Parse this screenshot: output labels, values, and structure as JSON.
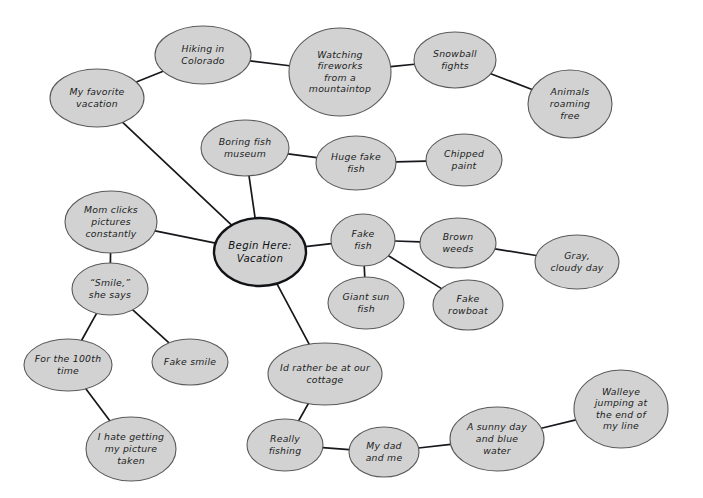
{
  "diagram": {
    "type": "mind-map",
    "background_color": "#ffffff",
    "node_fill_color": "#d2d2d2",
    "node_stroke_color": "#5a5a5a",
    "root_stroke_color": "#111317",
    "edge_color": "#16181c",
    "text_color": "#1b1d22",
    "canvas": {
      "width": 703,
      "height": 498
    }
  },
  "nodes": [
    {
      "id": "root",
      "label_lines": [
        "Begin Here:",
        "Vacation"
      ],
      "cx": 260,
      "cy": 252,
      "rx": 46,
      "ry": 34,
      "is_root": true
    },
    {
      "id": "my-favorite-vacation",
      "label_lines": [
        "My favorite",
        "vacation"
      ],
      "cx": 97,
      "cy": 98,
      "rx": 47,
      "ry": 29,
      "is_root": false
    },
    {
      "id": "hiking-in-colorado",
      "label_lines": [
        "Hiking in",
        "Colorado"
      ],
      "cx": 203,
      "cy": 55,
      "rx": 48,
      "ry": 29,
      "is_root": false
    },
    {
      "id": "watching-fireworks",
      "label_lines": [
        "Watching",
        "fireworks",
        "from a",
        "mountaintop"
      ],
      "cx": 340,
      "cy": 72,
      "rx": 51,
      "ry": 44,
      "is_root": false
    },
    {
      "id": "snowball-fights",
      "label_lines": [
        "Snowball",
        "fights"
      ],
      "cx": 455,
      "cy": 60,
      "rx": 41,
      "ry": 28,
      "is_root": false
    },
    {
      "id": "animals-roaming-free",
      "label_lines": [
        "Animals",
        "roaming",
        "free"
      ],
      "cx": 570,
      "cy": 104,
      "rx": 42,
      "ry": 34,
      "is_root": false
    },
    {
      "id": "boring-fish-museum",
      "label_lines": [
        "Boring fish",
        "museum"
      ],
      "cx": 245,
      "cy": 148,
      "rx": 44,
      "ry": 28,
      "is_root": false
    },
    {
      "id": "huge-fake-fish",
      "label_lines": [
        "Huge fake",
        "fish"
      ],
      "cx": 356,
      "cy": 163,
      "rx": 40,
      "ry": 27,
      "is_root": false
    },
    {
      "id": "chipped-paint",
      "label_lines": [
        "Chipped",
        "paint"
      ],
      "cx": 464,
      "cy": 160,
      "rx": 38,
      "ry": 26,
      "is_root": false
    },
    {
      "id": "mom-clicks-pictures",
      "label_lines": [
        "Mom clicks",
        "pictures",
        "constantly"
      ],
      "cx": 111,
      "cy": 222,
      "rx": 46,
      "ry": 31,
      "is_root": false
    },
    {
      "id": "smile-she-says",
      "label_lines": [
        "“Smile,”",
        "she says"
      ],
      "cx": 110,
      "cy": 289,
      "rx": 38,
      "ry": 26,
      "is_root": false
    },
    {
      "id": "for-the-100th-time",
      "label_lines": [
        "For the 100th",
        "time"
      ],
      "cx": 68,
      "cy": 365,
      "rx": 44,
      "ry": 26,
      "is_root": false
    },
    {
      "id": "fake-smile",
      "label_lines": [
        "Fake smile"
      ],
      "cx": 190,
      "cy": 362,
      "rx": 38,
      "ry": 23,
      "is_root": false
    },
    {
      "id": "i-hate-getting-my-picture-taken",
      "label_lines": [
        "I hate getting",
        "my picture",
        "taken"
      ],
      "cx": 131,
      "cy": 449,
      "rx": 45,
      "ry": 32,
      "is_root": false
    },
    {
      "id": "fake-fish",
      "label_lines": [
        "Fake",
        "fish"
      ],
      "cx": 363,
      "cy": 240,
      "rx": 32,
      "ry": 26,
      "is_root": false
    },
    {
      "id": "brown-weeds",
      "label_lines": [
        "Brown",
        "weeds"
      ],
      "cx": 458,
      "cy": 243,
      "rx": 38,
      "ry": 25,
      "is_root": false
    },
    {
      "id": "gray-cloudy-day",
      "label_lines": [
        "Gray,",
        "cloudy day"
      ],
      "cx": 577,
      "cy": 262,
      "rx": 42,
      "ry": 27,
      "is_root": false
    },
    {
      "id": "giant-sun-fish",
      "label_lines": [
        "Giant sun",
        "fish"
      ],
      "cx": 366,
      "cy": 303,
      "rx": 38,
      "ry": 26,
      "is_root": false
    },
    {
      "id": "fake-rowboat",
      "label_lines": [
        "Fake",
        "rowboat"
      ],
      "cx": 468,
      "cy": 305,
      "rx": 35,
      "ry": 25,
      "is_root": false
    },
    {
      "id": "id-rather-be-at-our-cottage",
      "label_lines": [
        "Id rather be at our",
        "cottage"
      ],
      "cx": 325,
      "cy": 374,
      "rx": 57,
      "ry": 31,
      "is_root": false
    },
    {
      "id": "really-fishing",
      "label_lines": [
        "Really",
        "fishing"
      ],
      "cx": 285,
      "cy": 445,
      "rx": 38,
      "ry": 26,
      "is_root": false
    },
    {
      "id": "my-dad-and-me",
      "label_lines": [
        "My dad",
        "and me"
      ],
      "cx": 384,
      "cy": 452,
      "rx": 35,
      "ry": 25,
      "is_root": false
    },
    {
      "id": "a-sunny-day-and-blue-water",
      "label_lines": [
        "A sunny day",
        "and blue",
        "water"
      ],
      "cx": 497,
      "cy": 439,
      "rx": 47,
      "ry": 32,
      "is_root": false
    },
    {
      "id": "walleye-jumping",
      "label_lines": [
        "Walleye",
        "jumping at",
        "the end of",
        "my line"
      ],
      "cx": 621,
      "cy": 409,
      "rx": 47,
      "ry": 39,
      "is_root": false
    }
  ],
  "edges": [
    {
      "id": "e-root-myfav",
      "from": "root",
      "to": "my-favorite-vacation"
    },
    {
      "id": "e-myfav-hiking",
      "from": "my-favorite-vacation",
      "to": "hiking-in-colorado"
    },
    {
      "id": "e-hiking-fireworks",
      "from": "hiking-in-colorado",
      "to": "watching-fireworks"
    },
    {
      "id": "e-fireworks-snow",
      "from": "watching-fireworks",
      "to": "snowball-fights"
    },
    {
      "id": "e-snow-animals",
      "from": "snowball-fights",
      "to": "animals-roaming-free"
    },
    {
      "id": "e-root-boring",
      "from": "root",
      "to": "boring-fish-museum"
    },
    {
      "id": "e-boring-huge",
      "from": "boring-fish-museum",
      "to": "huge-fake-fish"
    },
    {
      "id": "e-huge-chipped",
      "from": "huge-fake-fish",
      "to": "chipped-paint"
    },
    {
      "id": "e-root-mom",
      "from": "root",
      "to": "mom-clicks-pictures"
    },
    {
      "id": "e-mom-smile",
      "from": "mom-clicks-pictures",
      "to": "smile-she-says"
    },
    {
      "id": "e-smile-100th",
      "from": "smile-she-says",
      "to": "for-the-100th-time"
    },
    {
      "id": "e-smile-fakesmile",
      "from": "smile-she-says",
      "to": "fake-smile"
    },
    {
      "id": "e-100th-ihate",
      "from": "for-the-100th-time",
      "to": "i-hate-getting-my-picture-taken"
    },
    {
      "id": "e-root-fakefish",
      "from": "root",
      "to": "fake-fish"
    },
    {
      "id": "e-fakefish-brown",
      "from": "fake-fish",
      "to": "brown-weeds"
    },
    {
      "id": "e-brown-gray",
      "from": "brown-weeds",
      "to": "gray-cloudy-day"
    },
    {
      "id": "e-fakefish-giant",
      "from": "fake-fish",
      "to": "giant-sun-fish"
    },
    {
      "id": "e-fakefish-rowboat",
      "from": "fake-fish",
      "to": "fake-rowboat"
    },
    {
      "id": "e-root-cottage",
      "from": "root",
      "to": "id-rather-be-at-our-cottage"
    },
    {
      "id": "e-cottage-really",
      "from": "id-rather-be-at-our-cottage",
      "to": "really-fishing"
    },
    {
      "id": "e-really-dad",
      "from": "really-fishing",
      "to": "my-dad-and-me"
    },
    {
      "id": "e-dad-sunny",
      "from": "my-dad-and-me",
      "to": "a-sunny-day-and-blue-water"
    },
    {
      "id": "e-sunny-walleye",
      "from": "a-sunny-day-and-blue-water",
      "to": "walleye-jumping"
    }
  ]
}
